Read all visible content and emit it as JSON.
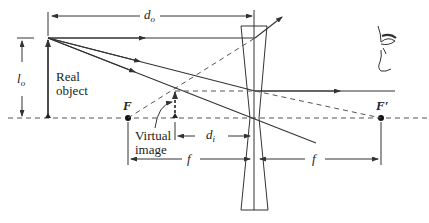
{
  "diagram": {
    "type": "optics-ray-diagram",
    "labels": {
      "object_distance": "d",
      "object_distance_sub": "o",
      "object_height": "l",
      "object_height_sub": "o",
      "image_distance": "d",
      "image_distance_sub": "i",
      "real_object_line1": "Real",
      "real_object_line2": "object",
      "virtual_image_line1": "Virtual",
      "virtual_image_line2": "image",
      "focal_point_near": "F",
      "focal_point_far": "F′",
      "focal_length_left": "f",
      "focal_length_right": "f"
    },
    "colors": {
      "line": "#333333",
      "dashed": "#555555",
      "background": "#ffffff"
    }
  }
}
